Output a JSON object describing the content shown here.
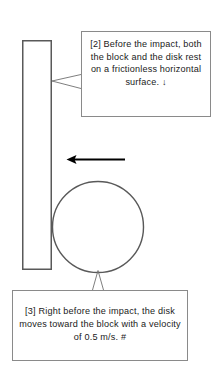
{
  "figure": {
    "background_color": "#ffffff",
    "stroke_color": "#595959",
    "arrow_color": "#000000",
    "callout_border_color": "#8a8a8a",
    "text_color": "#1a1a1a"
  },
  "shapes": {
    "block": {
      "name": "block",
      "kind": "rectangle",
      "x": 22,
      "y": 40,
      "width": 29,
      "height": 229,
      "fill": "#ffffff",
      "stroke": "#595959"
    },
    "disk": {
      "name": "disk",
      "kind": "circle",
      "cx": 98,
      "cy": 227,
      "r": 45.5,
      "fill": "#ffffff",
      "stroke": "#595959"
    },
    "velocity_arrow": {
      "name": "velocity-arrow",
      "kind": "arrow",
      "direction": "left",
      "x_tail": 125,
      "x_tip": 67,
      "y": 159,
      "stroke": "#000000"
    }
  },
  "callouts": [
    {
      "id": "callout-block",
      "label": "[2]",
      "text": "[2] Before the impact, both the block and the disk rest on a frictionless horizontal surface.  ↓",
      "anchor": {
        "x": 52,
        "y": 81
      },
      "box": {
        "x": 81,
        "y": 31,
        "width": 130,
        "height": 86
      }
    },
    {
      "id": "callout-disk",
      "label": "[3]",
      "text": "[3] Right before the impact, the disk moves toward the block with a velocity of 0.5 m/s.  #",
      "anchor": {
        "x": 98,
        "y": 270
      },
      "box": {
        "x": 12,
        "y": 290,
        "width": 176,
        "height": 71
      }
    }
  ],
  "physics": {
    "velocity_value": "0.5",
    "velocity_unit": "m/s",
    "surface": "frictionless horizontal"
  }
}
